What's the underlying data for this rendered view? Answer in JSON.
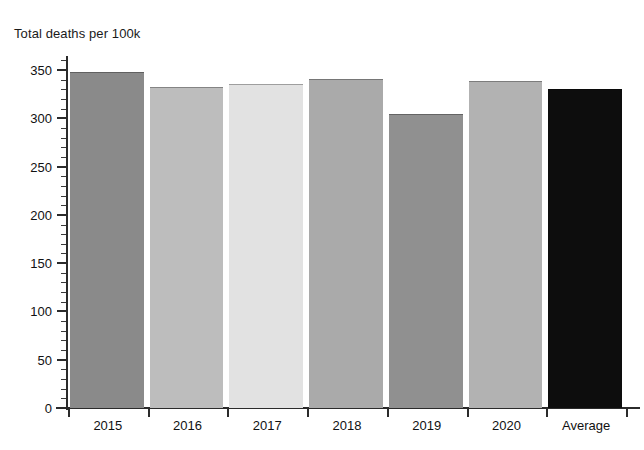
{
  "chart_data": {
    "type": "bar",
    "title": "Total deaths per 100k",
    "xlabel": "",
    "ylabel": "",
    "categories": [
      "2015",
      "2016",
      "2017",
      "2018",
      "2019",
      "2020",
      "Average"
    ],
    "values": [
      348,
      332,
      336,
      341,
      304,
      339,
      330
    ],
    "ylim": [
      0,
      362
    ],
    "ytick_labels": [
      "0",
      "50",
      "100",
      "150",
      "200",
      "250",
      "300",
      "350"
    ],
    "ytick_values": [
      0,
      50,
      100,
      150,
      200,
      250,
      300,
      350
    ],
    "minor_tick_step": 10,
    "grid": false,
    "legend": "none",
    "bar_colors": [
      "#8a8a8a",
      "#bdbdbd",
      "#e2e2e2",
      "#aaaaaa",
      "#909090",
      "#b2b2b2",
      "#0d0d0d"
    ],
    "axis_color": "#2b2b2b",
    "background": "#ffffff"
  }
}
